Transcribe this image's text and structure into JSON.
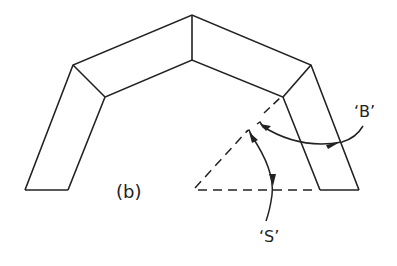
{
  "figure": {
    "panel_label": "(b)",
    "labels": {
      "bend_angle": "‘B’",
      "spring_angle": "‘S’"
    },
    "colors": {
      "stroke": "#222222",
      "background": "#ffffff"
    },
    "shape": {
      "outer_path": [
        [
          25,
          190
        ],
        [
          73,
          65
        ],
        [
          192,
          15
        ],
        [
          311,
          65
        ],
        [
          359,
          190
        ]
      ],
      "inner_path": [
        [
          68,
          190
        ],
        [
          105,
          97
        ],
        [
          192,
          60
        ],
        [
          283,
          97
        ],
        [
          320,
          190
        ]
      ]
    }
  }
}
